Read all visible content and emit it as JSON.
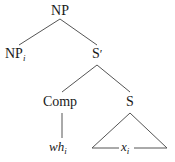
{
  "diagram": {
    "type": "syntax-tree",
    "nodes": {
      "root": {
        "label": "NP"
      },
      "np_i": {
        "label": "NP",
        "subscript": "i"
      },
      "s_bar": {
        "label": "S",
        "prime": "′"
      },
      "comp": {
        "label": "Comp"
      },
      "s": {
        "label": "S"
      },
      "wh": {
        "label": "wh",
        "subscript": "i"
      },
      "x": {
        "label": "x",
        "subscript": "i"
      }
    },
    "edges": [
      [
        "root",
        "np_i"
      ],
      [
        "root",
        "s_bar"
      ],
      [
        "s_bar",
        "comp"
      ],
      [
        "s_bar",
        "s"
      ],
      [
        "comp",
        "wh"
      ],
      [
        "s",
        "x (triangle)"
      ]
    ],
    "colors": {
      "text": "#1a1a1a",
      "line": "#555555",
      "background": "#ffffff"
    }
  }
}
